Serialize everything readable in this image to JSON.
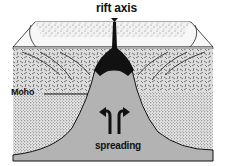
{
  "diagram": {
    "type": "block cross-section",
    "labels": {
      "rift_axis": "rift axis",
      "moho": "Moho",
      "spreading": "spreading"
    },
    "layers": [
      {
        "name": "sediment",
        "pattern": "light stipple"
      },
      {
        "name": "oceanic-crust",
        "pattern": "dashed hatch"
      },
      {
        "name": "mantle",
        "pattern": "dense stipple"
      },
      {
        "name": "upwelling-asthenosphere",
        "pattern": "solid grey"
      },
      {
        "name": "magma-chamber",
        "pattern": "solid black"
      }
    ],
    "colors": {
      "grey": "#b3b3b3",
      "ink": "#111111",
      "paper": "#ffffff",
      "stipple_bg": "#ececec",
      "crust_bg": "#d9d9d9"
    }
  }
}
